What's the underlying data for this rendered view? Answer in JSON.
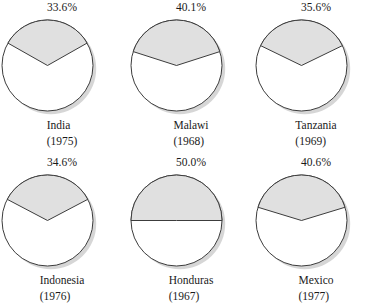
{
  "figure": {
    "type": "pie-chart-grid",
    "rows": 2,
    "columns": 3
  },
  "style": {
    "wedge_fill": "#e0e0e0",
    "slice_fill": "#ffffff",
    "stroke": "#3c3c3c",
    "shadow": "#b4b4b4",
    "background": "#ffffff"
  },
  "chart_data": [
    {
      "type": "pie",
      "title": "India",
      "subtitle": "(1975)",
      "categories": [
        "Shaded share",
        "Remainder"
      ],
      "values": [
        33.6,
        66.4
      ],
      "data_label": "33.6%",
      "ylabel": "",
      "xlabel": ""
    },
    {
      "type": "pie",
      "title": "Malawi",
      "subtitle": "(1968)",
      "categories": [
        "Shaded share",
        "Remainder"
      ],
      "values": [
        40.1,
        59.9
      ],
      "data_label": "40.1%",
      "ylabel": "",
      "xlabel": ""
    },
    {
      "type": "pie",
      "title": "Tanzania",
      "subtitle": "(1969)",
      "categories": [
        "Shaded share",
        "Remainder"
      ],
      "values": [
        35.6,
        64.4
      ],
      "data_label": "35.6%",
      "ylabel": "",
      "xlabel": ""
    },
    {
      "type": "pie",
      "title": "Indonesia",
      "subtitle": "(1976)",
      "categories": [
        "Shaded share",
        "Remainder"
      ],
      "values": [
        34.6,
        65.4
      ],
      "data_label": "34.6%",
      "ylabel": "",
      "xlabel": ""
    },
    {
      "type": "pie",
      "title": "Honduras",
      "subtitle": "(1967)",
      "categories": [
        "Shaded share",
        "Remainder"
      ],
      "values": [
        50.0,
        50.0
      ],
      "data_label": "50.0%",
      "ylabel": "",
      "xlabel": ""
    },
    {
      "type": "pie",
      "title": "Mexico",
      "subtitle": "(1977)",
      "categories": [
        "Shaded share",
        "Remainder"
      ],
      "values": [
        40.6,
        59.6
      ],
      "data_label": "40.6%",
      "ylabel": "",
      "xlabel": ""
    }
  ]
}
